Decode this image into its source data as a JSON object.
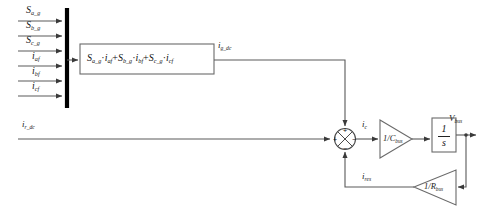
{
  "diagram": {
    "inputs": [
      {
        "id": "s-a-g",
        "base": "S",
        "sub": "a_g"
      },
      {
        "id": "s-b-g",
        "base": "S",
        "sub": "b_g"
      },
      {
        "id": "s-c-g",
        "base": "S",
        "sub": "c_g"
      },
      {
        "id": "i-af",
        "base": "i",
        "sub": "af"
      },
      {
        "id": "i-bf",
        "base": "i",
        "sub": "bf"
      },
      {
        "id": "i-cf",
        "base": "i",
        "sub": "cf"
      }
    ],
    "equation_block": {
      "terms": [
        {
          "gate": "S",
          "gate_sub": "a_g",
          "current": "i",
          "current_sub": "af"
        },
        {
          "gate": "S",
          "gate_sub": "b_g",
          "current": "i",
          "current_sub": "bf"
        },
        {
          "gate": "S",
          "gate_sub": "c_g",
          "current": "i",
          "current_sub": "cf"
        }
      ],
      "operator": "+",
      "multiply": "·"
    },
    "signals": {
      "grid_dc_current": {
        "base": "i",
        "sub": "g_dc"
      },
      "rectifier_dc_current": {
        "base": "i",
        "sub": "r_dc"
      },
      "capacitor_current": {
        "base": "i",
        "sub": "c"
      },
      "resistor_current": {
        "base": "i",
        "sub": "res"
      },
      "bus_voltage": {
        "base": "V",
        "sub": "bus"
      }
    },
    "gain_capacitance": {
      "numerator": "1",
      "denominator": "C",
      "denominator_sub": "bus",
      "text": "1/C_bus"
    },
    "gain_resistance": {
      "numerator": "1",
      "denominator": "R",
      "denominator_sub": "bus",
      "text": "1/R_bus"
    },
    "integrator": {
      "numerator": "1",
      "denominator": "s"
    },
    "summing_junction": {
      "signs": {
        "left": "+",
        "top": "+",
        "bottom": "−",
        "right": "−"
      }
    },
    "colors": {
      "line": "#555555",
      "bus_bar": "#000000",
      "block_border": "#6a6a6a",
      "text": "#1a1a1a",
      "background": "#ffffff"
    }
  }
}
